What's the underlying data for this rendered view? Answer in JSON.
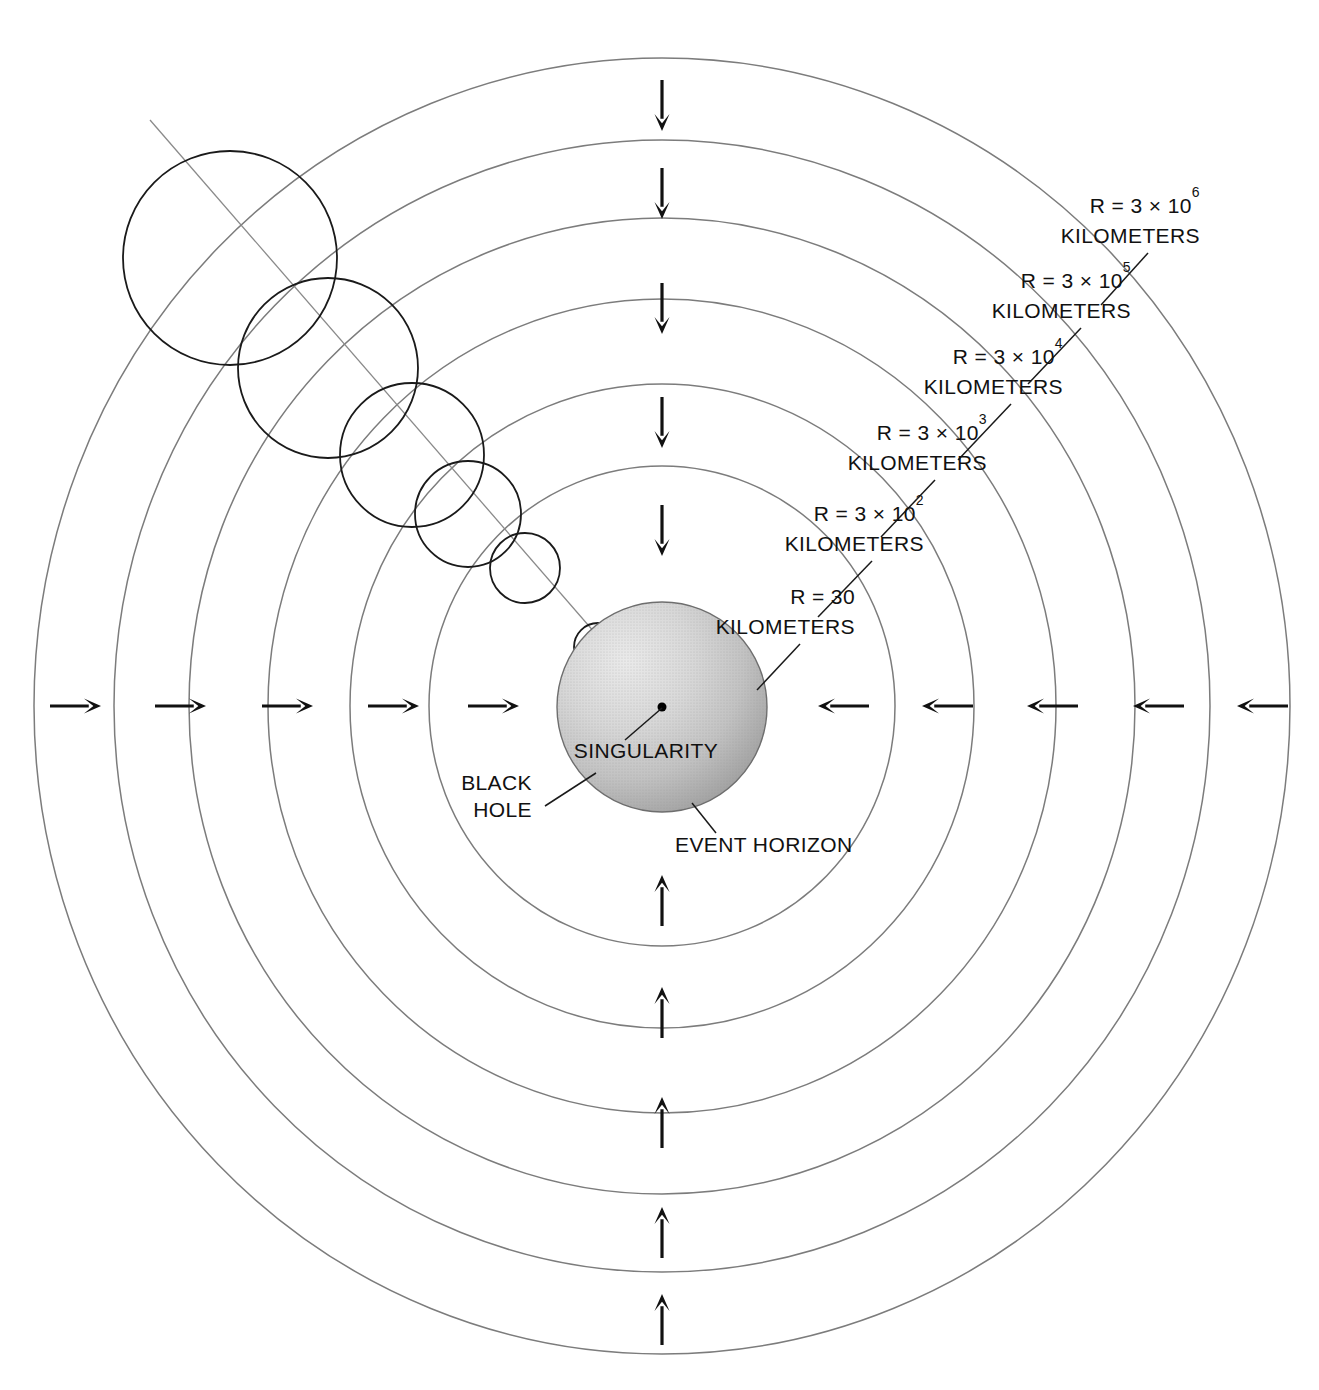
{
  "figure": {
    "background_color": "#ffffff",
    "ring_stroke_color": "#7c7c7c",
    "star_stroke_color": "#1a1a1a",
    "arrow_color": "#111111",
    "black_hole_fill_light": "#e3e3e3",
    "black_hole_fill_dark": "#9a9a9a"
  },
  "center": {
    "cx": 662,
    "cy": 706
  },
  "radius_labels": [
    {
      "id": "r-3e6",
      "prefix": "R = 3 × 10",
      "exponent": "6",
      "unit": "KILOMETERS",
      "full_text": "R = 3 × 10^6 KILOMETERS",
      "text_x": 1200,
      "text_y": 213,
      "unit_y": 243,
      "leader": {
        "x1": 1148,
        "y1": 253,
        "x2": 1101,
        "y2": 305
      }
    },
    {
      "id": "r-3e5",
      "prefix": "R = 3 × 10",
      "exponent": "5",
      "unit": "KILOMETERS",
      "full_text": "R = 3 × 10^5 KILOMETERS",
      "text_x": 1131,
      "text_y": 288,
      "unit_y": 318,
      "leader": {
        "x1": 1081,
        "y1": 328,
        "x2": 1028,
        "y2": 384
      }
    },
    {
      "id": "r-3e4",
      "prefix": "R = 3 × 10",
      "exponent": "4",
      "unit": "KILOMETERS",
      "full_text": "R = 3 × 10^4 KILOMETERS",
      "text_x": 1063,
      "text_y": 364,
      "unit_y": 394,
      "leader": {
        "x1": 1011,
        "y1": 404,
        "x2": 958,
        "y2": 460
      }
    },
    {
      "id": "r-3e3",
      "prefix": "R = 3 × 10",
      "exponent": "3",
      "unit": "KILOMETERS",
      "full_text": "R = 3 × 10^3 KILOMETERS",
      "text_x": 987,
      "text_y": 440,
      "unit_y": 470,
      "leader": {
        "x1": 935,
        "y1": 480,
        "x2": 881,
        "y2": 537
      }
    },
    {
      "id": "r-3e2",
      "prefix": "R = 3 × 10",
      "exponent": "2",
      "unit": "KILOMETERS",
      "full_text": "R = 3 × 10^2 KILOMETERS",
      "text_x": 924,
      "text_y": 521,
      "unit_y": 551,
      "leader": {
        "x1": 872,
        "y1": 561,
        "x2": 818,
        "y2": 617
      }
    },
    {
      "id": "r-30",
      "prefix": "R = 30",
      "exponent": "",
      "unit": "KILOMETERS",
      "full_text": "R = 30 KILOMETERS",
      "text_x": 855,
      "text_y": 604,
      "unit_y": 634,
      "leader": {
        "x1": 800,
        "y1": 644,
        "x2": 757,
        "y2": 690
      }
    }
  ],
  "annotations": [
    {
      "id": "singularity",
      "text": "SINGULARITY",
      "text_x": 646,
      "text_y": 758,
      "anchor": "middle",
      "leader": {
        "x1": 625,
        "y1": 740,
        "x2": 662,
        "y2": 708
      }
    },
    {
      "id": "black-hole",
      "line1": "BLACK",
      "line2": "HOLE",
      "text_x": 532,
      "line1_y": 790,
      "line2_y": 817,
      "anchor": "end",
      "leader": {
        "x1": 545,
        "y1": 806,
        "x2": 596,
        "y2": 773
      }
    },
    {
      "id": "event-horizon",
      "text": "EVENT HORIZON",
      "text_x": 675,
      "text_y": 852,
      "anchor": "start",
      "leader": {
        "x1": 716,
        "y1": 833,
        "x2": 692,
        "y2": 803
      }
    }
  ],
  "rings": [
    {
      "id": "ring-30km",
      "rx": 233,
      "ry": 240
    },
    {
      "id": "ring-3e2",
      "rx": 312,
      "ry": 322
    },
    {
      "id": "ring-3e3",
      "rx": 394,
      "ry": 407
    },
    {
      "id": "ring-3e4",
      "rx": 473,
      "ry": 488
    },
    {
      "id": "ring-3e5",
      "rx": 548,
      "ry": 566
    },
    {
      "id": "ring-3e6",
      "rx": 628,
      "ry": 648
    }
  ],
  "black_hole": {
    "id": "event-horizon-sphere",
    "cx": 662,
    "cy": 707,
    "r": 105,
    "singularity_r": 4.5
  },
  "collapsing_star_circles": [
    {
      "id": "star-stage-1",
      "cx": 230,
      "cy": 258,
      "r": 107
    },
    {
      "id": "star-stage-2",
      "cx": 328,
      "cy": 368,
      "r": 90
    },
    {
      "id": "star-stage-3",
      "cx": 412,
      "cy": 455,
      "r": 72
    },
    {
      "id": "star-stage-4",
      "cx": 468,
      "cy": 514,
      "r": 53
    },
    {
      "id": "star-stage-5",
      "cx": 525,
      "cy": 568,
      "r": 35
    },
    {
      "id": "star-stage-6",
      "cx": 598,
      "cy": 647,
      "r": 24
    }
  ],
  "infall_trajectory": {
    "id": "collapse-path",
    "x1": 150,
    "y1": 120,
    "x2": 648,
    "y2": 694
  },
  "arrows": {
    "direction_note": "All arrows point inward toward the black hole",
    "top_down": [
      {
        "x": 662,
        "y_tail": 80,
        "y_tip": 131
      },
      {
        "x": 662,
        "y_tail": 168,
        "y_tip": 219
      },
      {
        "x": 662,
        "y_tail": 283,
        "y_tip": 334
      },
      {
        "x": 662,
        "y_tail": 397,
        "y_tip": 448
      },
      {
        "x": 662,
        "y_tail": 505,
        "y_tip": 556
      }
    ],
    "bottom_up": [
      {
        "x": 662,
        "y_tail": 926,
        "y_tip": 875
      },
      {
        "x": 662,
        "y_tail": 1038,
        "y_tip": 987
      },
      {
        "x": 662,
        "y_tail": 1148,
        "y_tip": 1097
      },
      {
        "x": 662,
        "y_tail": 1258,
        "y_tip": 1207
      },
      {
        "x": 662,
        "y_tail": 1345,
        "y_tip": 1294
      }
    ],
    "left_right": [
      {
        "y": 706,
        "x_tail": 50,
        "x_tip": 101
      },
      {
        "y": 706,
        "x_tail": 155,
        "x_tip": 206
      },
      {
        "y": 706,
        "x_tail": 262,
        "x_tip": 313
      },
      {
        "y": 706,
        "x_tail": 368,
        "x_tip": 419
      },
      {
        "y": 706,
        "x_tail": 468,
        "x_tip": 519
      }
    ],
    "right_left": [
      {
        "y": 706,
        "x_tail": 869,
        "x_tip": 818
      },
      {
        "y": 706,
        "x_tail": 973,
        "x_tip": 922
      },
      {
        "y": 706,
        "x_tail": 1078,
        "x_tip": 1027
      },
      {
        "y": 706,
        "x_tail": 1184,
        "x_tip": 1133
      },
      {
        "y": 706,
        "x_tail": 1288,
        "x_tip": 1237
      }
    ]
  }
}
